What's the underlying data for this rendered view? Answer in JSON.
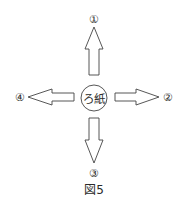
{
  "diagram": {
    "center_label": "ろ紙",
    "labels": {
      "up": "①",
      "right": "②",
      "down": "③",
      "left": "④"
    },
    "caption": "図5",
    "colors": {
      "stroke": "#444444",
      "fill": "#ffffff",
      "text": "#2a2a2a"
    }
  }
}
